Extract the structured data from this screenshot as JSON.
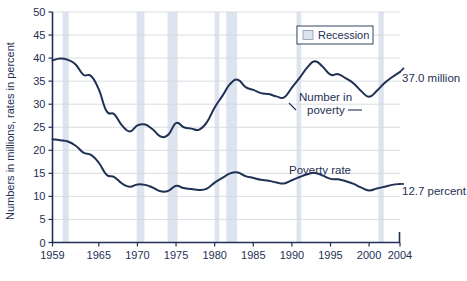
{
  "chart_data": {
    "type": "line",
    "title": "",
    "xlabel": "",
    "ylabel": "Numbers in millions, rates in percent",
    "xlim": [
      1959,
      2004
    ],
    "ylim": [
      0,
      50
    ],
    "grid": true,
    "y_ticks": [
      0,
      5,
      10,
      15,
      20,
      25,
      30,
      35,
      40,
      45,
      50
    ],
    "y_tick_labels": [
      "0",
      "5",
      "10",
      "15",
      "20",
      "25",
      "30",
      "35",
      "40",
      "45",
      "50"
    ],
    "x_ticks": [
      1959,
      1965,
      1970,
      1975,
      1980,
      1985,
      1990,
      1995,
      2000,
      2004
    ],
    "x_tick_labels": [
      "1959",
      "1965",
      "1970",
      "1975",
      "1980",
      "1985",
      "1990",
      "1995",
      "2000",
      "2004"
    ],
    "x": [
      1959,
      1960,
      1961,
      1962,
      1963,
      1964,
      1965,
      1966,
      1967,
      1968,
      1969,
      1970,
      1971,
      1972,
      1973,
      1974,
      1975,
      1976,
      1977,
      1978,
      1979,
      1980,
      1981,
      1982,
      1983,
      1984,
      1985,
      1986,
      1987,
      1988,
      1989,
      1990,
      1991,
      1992,
      1993,
      1994,
      1995,
      1996,
      1997,
      1998,
      1999,
      2000,
      2001,
      2002,
      2003,
      2004
    ],
    "series": [
      {
        "name": "Number in poverty",
        "unit": "millions",
        "end_value_label": "37.0 million",
        "values": [
          39.5,
          39.9,
          39.6,
          38.6,
          36.4,
          36.1,
          33.2,
          28.5,
          27.8,
          25.4,
          24.1,
          25.4,
          25.6,
          24.5,
          23.0,
          23.4,
          25.9,
          25.0,
          24.7,
          24.5,
          26.1,
          29.3,
          31.8,
          34.4,
          35.3,
          33.7,
          33.1,
          32.4,
          32.2,
          31.7,
          31.5,
          33.6,
          35.7,
          38.0,
          39.3,
          38.1,
          36.4,
          36.5,
          35.6,
          34.5,
          32.8,
          31.6,
          32.9,
          34.6,
          35.9,
          37.0
        ]
      },
      {
        "name": "Poverty rate",
        "unit": "percent",
        "end_value_label": "12.7 percent",
        "values": [
          22.4,
          22.2,
          21.9,
          21.0,
          19.5,
          19.0,
          17.3,
          14.7,
          14.2,
          12.8,
          12.1,
          12.6,
          12.5,
          11.9,
          11.1,
          11.2,
          12.3,
          11.8,
          11.6,
          11.4,
          11.7,
          13.0,
          14.0,
          15.0,
          15.2,
          14.4,
          14.0,
          13.6,
          13.4,
          13.0,
          12.8,
          13.5,
          14.2,
          14.8,
          15.1,
          14.5,
          13.8,
          13.7,
          13.3,
          12.7,
          11.9,
          11.3,
          11.7,
          12.1,
          12.5,
          12.7
        ]
      }
    ],
    "recessions": [
      {
        "start": 1960.3,
        "end": 1961.1
      },
      {
        "start": 1969.9,
        "end": 1970.9
      },
      {
        "start": 1973.9,
        "end": 1975.2
      },
      {
        "start": 1980.0,
        "end": 1980.6
      },
      {
        "start": 1981.5,
        "end": 1982.9
      },
      {
        "start": 1990.6,
        "end": 1991.2
      },
      {
        "start": 2001.2,
        "end": 2001.9
      }
    ],
    "legend": {
      "position": "top-right",
      "entries": [
        {
          "label": "Recession",
          "swatch": "#dde4ef"
        }
      ]
    },
    "annotations": [
      {
        "name": "number-in-poverty-label",
        "text_line_1": "Number in",
        "text_line_2": "poverty"
      },
      {
        "name": "poverty-rate-label",
        "text_line_1": "Poverty rate"
      }
    ],
    "colors": {
      "line": "#1f3054",
      "axis": "#1f3054",
      "grid": "#d6d9de",
      "recession_band": "#dde4ef",
      "text": "#1f3054",
      "background": "#ffffff"
    }
  },
  "axis": {
    "y_title": "Numbers in millions, rates in percent"
  },
  "legend": {
    "recession_label": "Recession"
  },
  "labels": {
    "number_in_poverty_line1": "Number in",
    "number_in_poverty_line2": "poverty",
    "poverty_rate": "Poverty rate",
    "number_end": "37.0 million",
    "rate_end": "12.7 percent"
  },
  "y_ticks": [
    "50",
    "45",
    "40",
    "35",
    "30",
    "25",
    "20",
    "15",
    "10",
    "5",
    "0"
  ],
  "x_ticks": [
    "1959",
    "1965",
    "1970",
    "1975",
    "1980",
    "1985",
    "1990",
    "1995",
    "2000",
    "2004"
  ]
}
